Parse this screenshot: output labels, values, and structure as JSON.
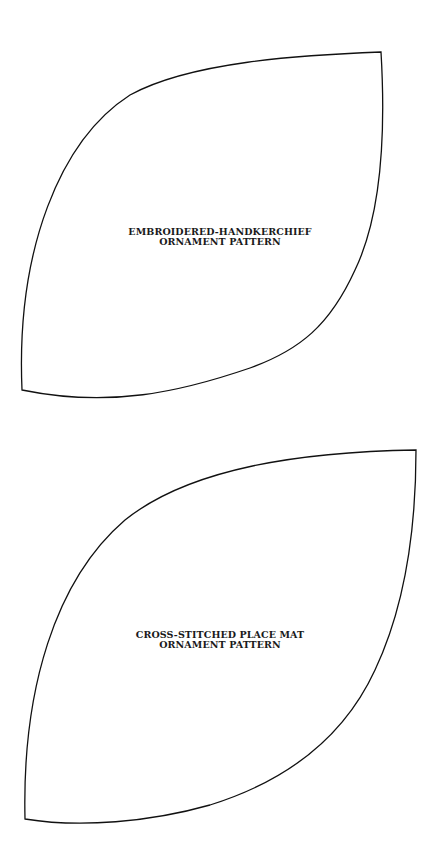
{
  "patterns": [
    {
      "line1": "EMBROIDERED-HANDKERCHIEF",
      "line2": "ORNAMENT PATTERN"
    },
    {
      "line1": "CROSS-STITCHED PLACE MAT",
      "line2": "ORNAMENT PATTERN"
    }
  ],
  "colors": {
    "outline": "#111111",
    "text": "#1a1a1a",
    "background": "#ffffff"
  }
}
